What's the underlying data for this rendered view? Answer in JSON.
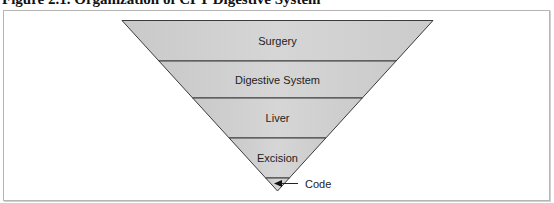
{
  "figure": {
    "title": "Figure 2.1.  Organization of CPT Digestive System"
  },
  "diagram": {
    "type": "inverted-pyramid",
    "levels": [
      {
        "label": "Surgery"
      },
      {
        "label": "Digestive System"
      },
      {
        "label": "Liver"
      },
      {
        "label": "Excision"
      },
      {
        "label": ""
      }
    ],
    "callout": {
      "label": "Code",
      "target_level": 4
    },
    "colors": {
      "fill": "#d0d0d0",
      "stroke": "#3a3a3a"
    }
  }
}
